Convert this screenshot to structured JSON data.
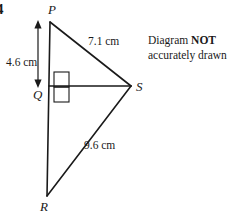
{
  "question": {
    "number": "4"
  },
  "note": {
    "line1_prefix": "Diagram ",
    "line1_emphasis": "NOT",
    "line2": "accurately drawn"
  },
  "figure": {
    "type": "geometry-diagram",
    "shape": "two right triangles sharing leg QS",
    "stroke_color": "#1a1a1a",
    "vertices": [
      {
        "id": "P",
        "label": "P",
        "x": 50,
        "y": 22
      },
      {
        "id": "Q",
        "label": "Q",
        "x": 49,
        "y": 86
      },
      {
        "id": "R",
        "label": "R",
        "x": 47,
        "y": 196
      },
      {
        "id": "S",
        "label": "S",
        "x": 131,
        "y": 86
      }
    ],
    "segments": [
      {
        "id": "PR",
        "from": "P",
        "to": "R",
        "label": ""
      },
      {
        "id": "QS",
        "from": "Q",
        "to": "S",
        "label": ""
      },
      {
        "id": "PS",
        "from": "P",
        "to": "S",
        "label": "7.1 cm"
      },
      {
        "id": "SR",
        "from": "S",
        "to": "R",
        "label": "9.6 cm"
      }
    ],
    "dimension_arrow": {
      "id": "PQ",
      "label": "4.6 cm",
      "orientation": "vertical",
      "double_headed": true,
      "x": 38,
      "y_start": 22,
      "y_end": 86
    },
    "right_angle": {
      "at_vertex": "Q",
      "marker": "square"
    }
  }
}
